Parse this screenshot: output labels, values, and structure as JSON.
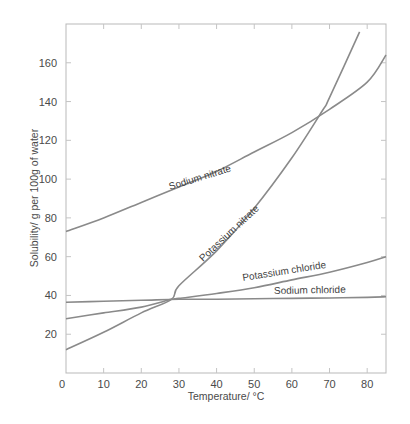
{
  "chart_data": {
    "type": "line",
    "title": "",
    "xlabel": "Temperature/ °C",
    "ylabel": "Solubility/ g per 100g of water",
    "xlim": [
      0,
      85
    ],
    "ylim": [
      0,
      180
    ],
    "x_ticks": [
      0,
      10,
      20,
      30,
      40,
      50,
      60,
      70,
      80
    ],
    "y_ticks": [
      20,
      40,
      60,
      80,
      100,
      120,
      140,
      160
    ],
    "grid": false,
    "legend": "inline labels on curves",
    "series": [
      {
        "name": "Sodium nitrate",
        "x": [
          0,
          10,
          20,
          30,
          40,
          50,
          60,
          70,
          80,
          85
        ],
        "y": [
          73,
          80,
          88,
          96,
          104,
          114,
          124,
          136,
          150,
          164
        ]
      },
      {
        "name": "Potassium nitrate",
        "x": [
          0,
          10,
          20,
          28,
          30,
          40,
          50,
          60,
          68,
          70,
          78
        ],
        "y": [
          12,
          21,
          31,
          38,
          45,
          63,
          85,
          111,
          135,
          142,
          176
        ]
      },
      {
        "name": "Potassium chloride",
        "x": [
          0,
          10,
          20,
          28,
          30,
          40,
          50,
          60,
          70,
          80,
          85
        ],
        "y": [
          28,
          31,
          34,
          38,
          38.5,
          41,
          44,
          48,
          52,
          57,
          60
        ]
      },
      {
        "name": "Sodium chloride",
        "x": [
          0,
          10,
          20,
          30,
          40,
          50,
          60,
          70,
          80,
          85
        ],
        "y": [
          36.5,
          37,
          37.5,
          38,
          38,
          38.3,
          38.5,
          38.7,
          39,
          39.3
        ]
      }
    ],
    "annotations": [
      "Sodium nitrate",
      "Potassium nitrate",
      "Potassium chloride",
      "Sodium chloride"
    ]
  },
  "labels": {
    "xlabel": "Temperature/ °C",
    "ylabel": "Solubility/ g per 100g of water",
    "curves": {
      "sodium_nitrate": "Sodium nitrate",
      "potassium_nitrate": "Potassium nitrate",
      "potassium_chloride": "Potassium chloride",
      "sodium_chloride": "Sodium chloride"
    }
  },
  "colors": {
    "curve": "#8a8a8a",
    "frame": "#b9b9b9",
    "text": "#4a4a4a"
  }
}
